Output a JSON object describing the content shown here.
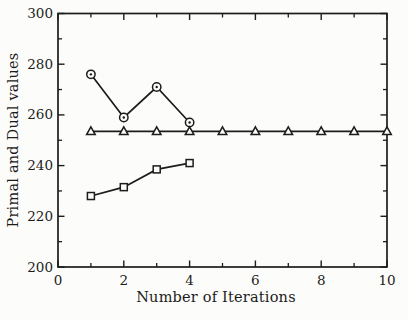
{
  "figure": {
    "background": "#fcfcfa",
    "ink": "#1c1c1c",
    "marker_fill": "#fcfcfa"
  },
  "chart_data": {
    "type": "line",
    "title": "",
    "xlabel": "Number of Iterations",
    "ylabel": "Primal and Dual values",
    "xlim": [
      0,
      10
    ],
    "ylim": [
      200,
      300
    ],
    "grid": false,
    "legend": "none",
    "frame": "box-with-mirrored-inward-ticks",
    "x_major_ticks": [
      0,
      2,
      4,
      6,
      8,
      10
    ],
    "x_major_tick_labels": [
      "0",
      "2",
      "4",
      "6",
      "8",
      "10"
    ],
    "x_minor_ticks": [
      1,
      3,
      5,
      7,
      9
    ],
    "y_major_ticks": [
      200,
      220,
      240,
      260,
      280,
      300
    ],
    "y_major_tick_labels": [
      "200",
      "220",
      "240",
      "260",
      "280",
      "300"
    ],
    "y_minor_ticks": [
      210,
      230,
      250,
      270,
      290
    ],
    "series": [
      {
        "name": "primal-upper-circles",
        "marker": "circle-dot",
        "x": [
          1,
          2,
          3,
          4
        ],
        "y": [
          276,
          259,
          271,
          257
        ]
      },
      {
        "name": "dual-constant-triangles",
        "marker": "triangle-up",
        "x": [
          1,
          2,
          3,
          4,
          5,
          6,
          7,
          8,
          9,
          10
        ],
        "y": [
          253.5,
          253.5,
          253.5,
          253.5,
          253.5,
          253.5,
          253.5,
          253.5,
          253.5,
          253.5
        ]
      },
      {
        "name": "primal-lower-squares",
        "marker": "square",
        "x": [
          1,
          2,
          3,
          4
        ],
        "y": [
          228,
          231.5,
          238.5,
          241
        ]
      }
    ]
  }
}
